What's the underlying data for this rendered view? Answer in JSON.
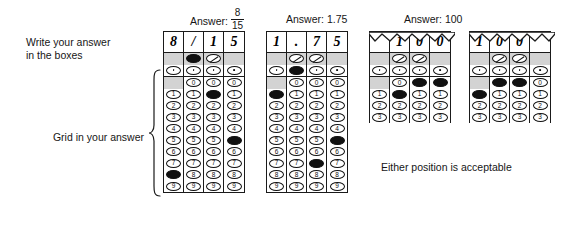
{
  "captions": {
    "write_answer": "Write your answer\nin the boxes",
    "grid_answer": "Grid in your answer",
    "either_position": "Either position is acceptable"
  },
  "answers": [
    {
      "prefix": "Answer:",
      "type": "fraction",
      "numerator": "8",
      "denominator": "15"
    },
    {
      "prefix": "Answer:",
      "type": "plain",
      "value": "1.75"
    },
    {
      "prefix": "Answer:",
      "type": "plain",
      "value": "100"
    }
  ],
  "digit_rows": [
    "0",
    "1",
    "2",
    "3",
    "4",
    "5",
    "6",
    "7",
    "8",
    "9"
  ],
  "grids": [
    {
      "name": "grid-fraction-8-15",
      "handwritten": [
        "8",
        "/",
        "1",
        "5"
      ],
      "fraction_bar_row": [
        "blank",
        "filled",
        "slash",
        "blank"
      ],
      "decimal_row": [
        "dot",
        "dot",
        "dot",
        "dot"
      ],
      "zero_row": [
        "blank",
        "0",
        "0",
        "0"
      ],
      "bubbles": [
        {
          "column": 1,
          "digit": "8"
        },
        {
          "column": 3,
          "digit": "1"
        },
        {
          "column": 4,
          "digit": "5"
        }
      ],
      "rows_shown": 10,
      "torn": false
    },
    {
      "name": "grid-decimal-1-75",
      "handwritten": [
        "1",
        ".",
        "7",
        "5"
      ],
      "fraction_bar_row": [
        "blank",
        "slash",
        "slash",
        "blank"
      ],
      "decimal_row": [
        "dot",
        "filled",
        "dot",
        "dot"
      ],
      "zero_row": [
        "blank",
        "0",
        "0",
        "0"
      ],
      "bubbles": [
        {
          "column": 1,
          "digit": "1"
        },
        {
          "column": 3,
          "digit": "7"
        },
        {
          "column": 4,
          "digit": "5"
        }
      ],
      "rows_shown": 10,
      "torn": false
    },
    {
      "name": "grid-100-right-aligned",
      "handwritten": [
        "",
        "1",
        "0",
        "0"
      ],
      "fraction_bar_row": [
        "blank",
        "slash",
        "slash",
        "blank"
      ],
      "decimal_row": [
        "dot",
        "dot",
        "dot",
        "dot"
      ],
      "zero_row": [
        "blank",
        "0",
        "filled",
        "filled"
      ],
      "bubbles": [
        {
          "column": 2,
          "digit": "1"
        }
      ],
      "rows_shown": 4,
      "torn": true
    },
    {
      "name": "grid-100-left-aligned",
      "handwritten": [
        "1",
        "0",
        "0",
        ""
      ],
      "fraction_bar_row": [
        "blank",
        "slash",
        "slash",
        "blank"
      ],
      "decimal_row": [
        "dot",
        "dot",
        "dot",
        "dot"
      ],
      "zero_row": [
        "blank",
        "filled",
        "filled",
        "0"
      ],
      "bubbles": [
        {
          "column": 1,
          "digit": "1"
        }
      ],
      "rows_shown": 4,
      "torn": true
    }
  ],
  "layout": {
    "grid_positions": [
      {
        "left": 163,
        "top": 31
      },
      {
        "left": 266,
        "top": 31
      },
      {
        "left": 369,
        "top": 31
      },
      {
        "left": 469,
        "top": 31
      }
    ]
  },
  "colors": {
    "ink": "#1a1a1a",
    "shade": "#d3d3d3",
    "paper": "#ffffff"
  }
}
